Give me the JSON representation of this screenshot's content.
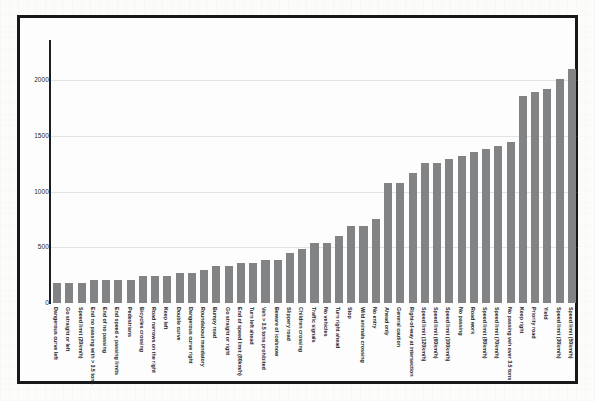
{
  "figure": {
    "bar_color": "#828385",
    "frame_color": "#17181a",
    "background": "#fdfdfd"
  },
  "chart_data": {
    "type": "bar",
    "title": "",
    "subtitle": "",
    "xlabel": "",
    "ylabel": "",
    "ylim": [
      0,
      2300
    ],
    "yticks": [
      0,
      500,
      1000,
      1500,
      2000
    ],
    "ytick_labels": [
      "0",
      "500",
      "1000",
      "1500",
      "2000"
    ],
    "grid": true,
    "legend": null,
    "orientation": "vertical",
    "sorted": "ascending",
    "categories": [
      "Dangerous curve left",
      "Go straight or left",
      "Speed limit (20km/h)",
      "End no passing with > 3.5 tons",
      "End of no passing",
      "End speed + passing limits",
      "Pedestrians",
      "Bicycles crossing",
      "Road narrows on the right",
      "Keep left",
      "Double curve",
      "Dangerous curve right",
      "Roundabout mandatory",
      "Bumpy road",
      "Go straight or right",
      "End of speed limit (80km/h)",
      "Turn left ahead",
      "Veh > 3.5 tons prohibited",
      "Beware of ice/snow",
      "Slippery road",
      "Children crossing",
      "Traffic signals",
      "No vehicles",
      "Turn right ahead",
      "Stop",
      "Wild animals crossing",
      "No entry",
      "Ahead only",
      "General caution",
      "Right-of-way at intersection",
      "Speed limit (120km/h)",
      "Speed limit (60km/h)",
      "Speed limit (100km/h)",
      "No passing",
      "Road work",
      "Speed limit (80km/h)",
      "Speed limit (70km/h)",
      "No passing veh over 3.5 tons",
      "Keep right",
      "Priority road",
      "Yield",
      "Speed limit (30km/h)",
      "Speed limit (50km/h)"
    ],
    "values": [
      180,
      180,
      180,
      210,
      210,
      210,
      210,
      240,
      240,
      240,
      270,
      270,
      300,
      330,
      330,
      360,
      360,
      390,
      390,
      450,
      480,
      540,
      540,
      599,
      690,
      690,
      750,
      1080,
      1080,
      1170,
      1260,
      1260,
      1290,
      1320,
      1350,
      1380,
      1410,
      1440,
      1860,
      1890,
      1920,
      2010,
      2100
    ]
  }
}
